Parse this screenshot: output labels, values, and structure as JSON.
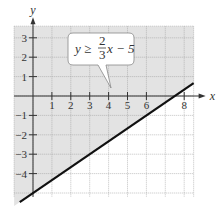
{
  "chart_data": {
    "type": "line",
    "title": "",
    "xlabel": "x",
    "ylabel": "y",
    "xlim": [
      -1,
      8.5
    ],
    "ylim": [
      -5.2,
      3.6
    ],
    "grid": true,
    "x_ticks": [
      1,
      2,
      3,
      4,
      5,
      6,
      8
    ],
    "y_ticks": [
      3,
      2,
      1,
      -1,
      -2,
      -3,
      -4
    ],
    "series": [
      {
        "name": "boundary line y = (2/3)x - 5",
        "type": "line",
        "style": "solid",
        "x": [
          -0.7,
          8.5
        ],
        "y": [
          -5.467,
          0.667
        ]
      }
    ],
    "shaded_region": "above the line (y ≥ (2/3)x − 5)",
    "annotation": {
      "text_lhs": "y ≥",
      "fraction_num": "2",
      "fraction_den": "3",
      "text_rhs": "x − 5",
      "points_to_line": true
    },
    "colors": {
      "shade": "#e3e3e3",
      "grid": "#9a9a9a",
      "line": "#111111",
      "axis": "#333333"
    }
  }
}
